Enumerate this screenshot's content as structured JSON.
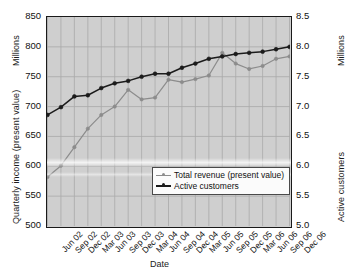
{
  "chart_data": {
    "type": "line",
    "title": "",
    "xlabel": "Date",
    "categories": [
      "Jun 02",
      "Sep 02",
      "Dec 02",
      "Mar 03",
      "Jun 03",
      "Sep 03",
      "Dec 03",
      "Mar 04",
      "Jun 04",
      "Sep 04",
      "Dec 04",
      "Mar 05",
      "Jun 05",
      "Sep 05",
      "Dec 05",
      "Mar 06",
      "Jun 06",
      "Sep 06",
      "Dec 06"
    ],
    "grid": true,
    "legend_position": "inside-bottom-center",
    "axes": {
      "left": {
        "label": "Quarterly income (present value)",
        "units": "Millions",
        "ticks": [
          "500",
          "550",
          "600",
          "650",
          "700",
          "750",
          "800",
          "850"
        ],
        "ylim": [
          500,
          850
        ]
      },
      "right": {
        "label": "Active customers",
        "units": "Millions",
        "ticks": [
          "5.0",
          "5.5",
          "6.0",
          "6.5",
          "7.0",
          "7.5",
          "8.0",
          "8.5"
        ],
        "ylim": [
          5.0,
          8.5
        ]
      }
    },
    "series": [
      {
        "name": "Total revenue (present value)",
        "axis": "left",
        "color": "#8c8c8c",
        "marker": "circle",
        "values": [
          582,
          601,
          632,
          663,
          686,
          700,
          728,
          712,
          715,
          745,
          741,
          746,
          752,
          790,
          772,
          763,
          768,
          780,
          784
        ]
      },
      {
        "name": "Active customers",
        "axis": "right",
        "color": "#1b1b1b",
        "marker": "circle",
        "values": [
          6.86,
          6.99,
          7.17,
          7.19,
          7.31,
          7.39,
          7.43,
          7.5,
          7.55,
          7.55,
          7.65,
          7.72,
          7.8,
          7.84,
          7.88,
          7.9,
          7.92,
          7.96,
          8.0
        ]
      }
    ]
  },
  "legend": {
    "items": [
      {
        "label": "Total revenue (present value)",
        "color": "#8c8c8c"
      },
      {
        "label": "Active customers",
        "color": "#1b1b1b"
      }
    ]
  }
}
